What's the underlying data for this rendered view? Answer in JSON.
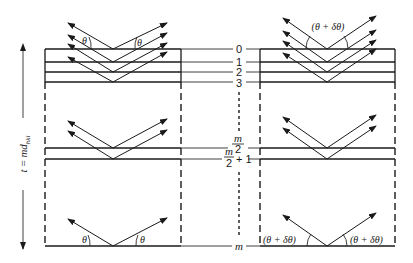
{
  "diagram": {
    "thickness_label": {
      "t": "t",
      "eq": " = ",
      "md": "md",
      "sub": "hkl"
    },
    "plane_labels": {
      "p0": "0",
      "p1": "1",
      "p2": "2",
      "p3": "3",
      "mid_num": "m",
      "mid_den": "2",
      "mid1_num": "m",
      "mid1_den": "2",
      "mid1_plus": "+ 1",
      "last": "m"
    },
    "left_panel": {
      "angle_top_left": "θ",
      "angle_top_right": "θ",
      "angle_bottom_left": "θ",
      "angle_bottom_right": "θ"
    },
    "right_panel": {
      "angle_top": "(θ + δθ)",
      "angle_bottom_left": "(θ + δθ)",
      "angle_bottom_right": "(θ + δθ)"
    }
  }
}
